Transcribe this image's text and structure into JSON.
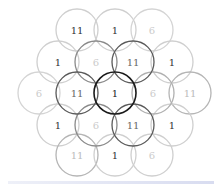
{
  "diagram": {
    "radius": 21,
    "cells": [
      {
        "label": "11",
        "x": 77,
        "y": 30,
        "stroke": "#cfcfcf",
        "text": "#333333"
      },
      {
        "label": "1",
        "x": 115,
        "y": 30,
        "stroke": "#cfcfcf",
        "text": "#333333"
      },
      {
        "label": "6",
        "x": 152,
        "y": 30,
        "stroke": "#d4d4d4",
        "text": "#cccccc"
      },
      {
        "label": "1",
        "x": 58,
        "y": 62,
        "stroke": "#cfcfcf",
        "text": "#333333"
      },
      {
        "label": "6",
        "x": 96,
        "y": 62,
        "stroke": "#8a8a8a",
        "text": "#cccccc"
      },
      {
        "label": "11",
        "x": 133,
        "y": 62,
        "stroke": "#5a5a5a",
        "text": "#666666"
      },
      {
        "label": "1",
        "x": 172,
        "y": 62,
        "stroke": "#cfcfcf",
        "text": "#333333"
      },
      {
        "label": "6",
        "x": 39,
        "y": 93,
        "stroke": "#d4d4d4",
        "text": "#cccccc"
      },
      {
        "label": "11",
        "x": 77,
        "y": 93,
        "stroke": "#5a5a5a",
        "text": "#666666"
      },
      {
        "label": "1",
        "x": 115,
        "y": 93,
        "stroke": "#1a1a1a",
        "text": "#222222"
      },
      {
        "label": "6",
        "x": 153,
        "y": 93,
        "stroke": "#b0b0b0",
        "text": "#cccccc"
      },
      {
        "label": "11",
        "x": 190,
        "y": 93,
        "stroke": "#b5b5b5",
        "text": "#bbbbbb"
      },
      {
        "label": "1",
        "x": 58,
        "y": 125,
        "stroke": "#cfcfcf",
        "text": "#333333"
      },
      {
        "label": "6",
        "x": 96,
        "y": 125,
        "stroke": "#8a8a8a",
        "text": "#cccccc"
      },
      {
        "label": "11",
        "x": 133,
        "y": 125,
        "stroke": "#5a5a5a",
        "text": "#666666"
      },
      {
        "label": "1",
        "x": 172,
        "y": 125,
        "stroke": "#cfcfcf",
        "text": "#333333"
      },
      {
        "label": "11",
        "x": 77,
        "y": 155,
        "stroke": "#b5b5b5",
        "text": "#bbbbbb"
      },
      {
        "label": "1",
        "x": 115,
        "y": 155,
        "stroke": "#cfcfcf",
        "text": "#333333"
      },
      {
        "label": "6",
        "x": 152,
        "y": 155,
        "stroke": "#cfcfcf",
        "text": "#cccccc"
      }
    ],
    "draw_order": [
      0,
      1,
      2,
      3,
      6,
      7,
      11,
      12,
      15,
      16,
      17,
      18,
      4,
      10,
      13,
      5,
      8,
      14,
      9
    ]
  }
}
